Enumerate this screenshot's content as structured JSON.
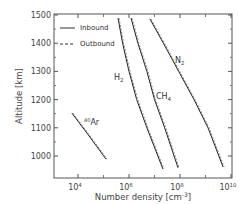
{
  "chart_data": {
    "type": "line",
    "title": "",
    "xlabel": "Number density [cm⁻³]",
    "ylabel": "Altitude [km]",
    "xscale": "log",
    "xlim": [
      1000,
      12000000000
    ],
    "ylim": [
      950,
      1500
    ],
    "xticks": [
      "10^4",
      "10^6",
      "10^8",
      "10^10"
    ],
    "xtick_labels": [
      {
        "base": "10",
        "exp": "4"
      },
      {
        "base": "10",
        "exp": "6"
      },
      {
        "base": "10",
        "exp": "8"
      },
      {
        "base": "10",
        "exp": "10"
      }
    ],
    "yticks": [
      1000,
      1100,
      1200,
      1300,
      1400,
      1500
    ],
    "grid": false,
    "legend": {
      "position": "upper left",
      "entries": [
        {
          "label": "Inbound",
          "style": "solid"
        },
        {
          "label": "Outbound",
          "style": "dashed"
        }
      ]
    },
    "series": [
      {
        "name": "H2",
        "label_main": "H",
        "label_sub": "2",
        "points_log10_density_altitude": [
          [
            5.57,
            1489
          ],
          [
            5.75,
            1400
          ],
          [
            6.0,
            1300
          ],
          [
            6.3,
            1200
          ],
          [
            6.7,
            1100
          ],
          [
            7.33,
            954
          ]
        ]
      },
      {
        "name": "CH4",
        "label_main": "CH",
        "label_sub": "4",
        "points_log10_density_altitude": [
          [
            6.08,
            1489
          ],
          [
            6.35,
            1400
          ],
          [
            6.7,
            1300
          ],
          [
            7.0,
            1200
          ],
          [
            7.4,
            1100
          ],
          [
            7.92,
            958
          ]
        ]
      },
      {
        "name": "N2",
        "label_main": "N",
        "label_sub": "2",
        "points_log10_density_altitude": [
          [
            6.82,
            1486
          ],
          [
            7.35,
            1400
          ],
          [
            7.95,
            1300
          ],
          [
            8.55,
            1200
          ],
          [
            9.1,
            1100
          ],
          [
            9.69,
            961
          ]
        ]
      },
      {
        "name": "40Ar",
        "label_main": "Ar",
        "label_sup": "40",
        "points_log10_density_altitude": [
          [
            3.76,
            1152
          ],
          [
            4.4,
            1075
          ],
          [
            5.1,
            989
          ]
        ]
      }
    ]
  },
  "axes": {
    "ylabel": "Altitude [km]",
    "xlabel_main": "Number density [cm",
    "xlabel_exp": "-3",
    "xlabel_end": "]"
  },
  "legend": {
    "inbound": "Inbound",
    "outbound": "Outbound"
  }
}
